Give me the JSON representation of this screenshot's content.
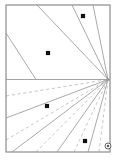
{
  "figure": {
    "background_color": "#ffffff",
    "width": 118,
    "height": 162
  },
  "frame": {
    "name": "plot-frame",
    "x": 6,
    "y": 5,
    "width": 104,
    "height": 147,
    "stroke": "#8c8c8c",
    "stroke_width": 1.2,
    "fill": "none"
  },
  "horizon": {
    "name": "horizon-line",
    "label": "horizon",
    "x1": 6,
    "y1": 79.5,
    "x2": 110,
    "y2": 79.5,
    "stroke": "#9a9a9a",
    "stroke_width": 0.9
  },
  "vanishing_point": {
    "name": "vanishing-point",
    "label": "vanishing point",
    "x": 108,
    "y": 79.5,
    "radius": 1.6,
    "color": "#999999"
  },
  "chart_data": {
    "type": "line",
    "xlabel": "",
    "ylabel": "",
    "xlim": [
      6,
      110
    ],
    "ylim": [
      5,
      152
    ],
    "grid": false,
    "legend": "none",
    "annotations": [
      "All rays converge at the vanishing point on the horizon line",
      "Upper rays are solid; lower rays alternate dashed and solid"
    ],
    "vanishing_point": [
      108,
      79.5
    ],
    "series": [
      {
        "name": "upper-ray-1",
        "style": "solid",
        "color": "#9a9a9a",
        "x": [
          37,
          108
        ],
        "y": [
          5,
          79.5
        ]
      },
      {
        "name": "upper-ray-2",
        "style": "solid",
        "color": "#9a9a9a",
        "x": [
          72,
          108
        ],
        "y": [
          5,
          79.5
        ]
      },
      {
        "name": "upper-ray-3",
        "style": "solid",
        "color": "#9a9a9a",
        "x": [
          93,
          108
        ],
        "y": [
          5,
          79.5
        ]
      },
      {
        "name": "upper-ray-4",
        "style": "solid",
        "color": "#9a9a9a",
        "x": [
          6,
          36
        ],
        "y": [
          33,
          79.5
        ]
      },
      {
        "name": "lower-ray-1",
        "style": "dashed",
        "color": "#bdbdbd",
        "x": [
          6,
          108
        ],
        "y": [
          96,
          79.5
        ]
      },
      {
        "name": "lower-ray-2",
        "style": "solid",
        "color": "#9a9a9a",
        "x": [
          6,
          108
        ],
        "y": [
          118,
          79.5
        ]
      },
      {
        "name": "lower-ray-3",
        "style": "dashed",
        "color": "#bdbdbd",
        "x": [
          6,
          108
        ],
        "y": [
          140,
          79.5
        ]
      },
      {
        "name": "lower-ray-4",
        "style": "solid",
        "color": "#9a9a9a",
        "x": [
          12,
          108
        ],
        "y": [
          152,
          79.5
        ]
      },
      {
        "name": "lower-ray-5",
        "style": "dashed",
        "color": "#bdbdbd",
        "x": [
          36,
          108
        ],
        "y": [
          152,
          79.5
        ]
      },
      {
        "name": "lower-ray-6",
        "style": "solid",
        "color": "#9a9a9a",
        "x": [
          57,
          108
        ],
        "y": [
          152,
          79.5
        ]
      },
      {
        "name": "lower-ray-7",
        "style": "dashed",
        "color": "#bdbdbd",
        "x": [
          74,
          108
        ],
        "y": [
          152,
          79.5
        ]
      },
      {
        "name": "lower-ray-8",
        "style": "solid",
        "color": "#9a9a9a",
        "x": [
          88,
          108
        ],
        "y": [
          152,
          79.5
        ]
      },
      {
        "name": "lower-ray-9",
        "style": "dashed",
        "color": "#bdbdbd",
        "x": [
          99,
          108
        ],
        "y": [
          152,
          79.5
        ]
      }
    ],
    "points": [
      {
        "name": "data-point-1",
        "x": 83,
        "y": 16,
        "size": 4.2,
        "color": "#111111",
        "shape": "square"
      },
      {
        "name": "data-point-2",
        "x": 48,
        "y": 53,
        "size": 4.2,
        "color": "#111111",
        "shape": "square"
      },
      {
        "name": "data-point-3",
        "x": 47,
        "y": 106,
        "size": 4.2,
        "color": "#111111",
        "shape": "square"
      },
      {
        "name": "data-point-4",
        "x": 85,
        "y": 141,
        "size": 4.2,
        "color": "#111111",
        "shape": "square"
      }
    ],
    "corner_marker": {
      "name": "corner-marker",
      "x": 108,
      "y": 146,
      "outer_radius": 3.0,
      "inner_radius": 1.2,
      "stroke": "#555555",
      "fill": "#ffffff"
    }
  }
}
